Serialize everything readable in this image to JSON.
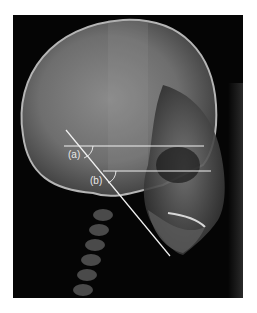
{
  "figure": {
    "labels": {
      "a": "(a)",
      "b": "(b)"
    },
    "colors": {
      "background": "#ffffff",
      "xray_bg": "#050505",
      "line": "#f2f2f2"
    }
  }
}
